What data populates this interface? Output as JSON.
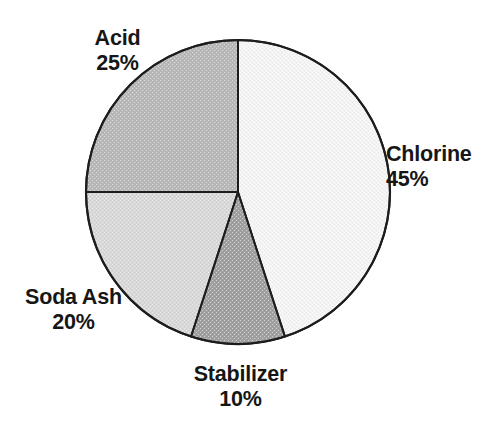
{
  "chart_data": {
    "type": "pie",
    "title": "",
    "subtitle": "",
    "xlabel": "",
    "ylabel": "",
    "legend_position": "none",
    "grid": false,
    "start_angle_deg": 0,
    "direction": "clockwise",
    "value_unit": "%",
    "categories": [
      "Chlorine",
      "Stabilizer",
      "Soda Ash",
      "Acid"
    ],
    "values": [
      45,
      10,
      20,
      25
    ],
    "slices": [
      {
        "name": "Chlorine",
        "value": 45,
        "value_label": "45%",
        "color": "#f4f4f4",
        "start_angle_deg": 0,
        "end_angle_deg": 162,
        "label_position": "right"
      },
      {
        "name": "Stabilizer",
        "value": 10,
        "value_label": "10%",
        "color": "#a0a0a0",
        "start_angle_deg": 162,
        "end_angle_deg": 198,
        "label_position": "bottom"
      },
      {
        "name": "Soda Ash",
        "value": 20,
        "value_label": "20%",
        "color": "#d8d8d8",
        "start_angle_deg": 198,
        "end_angle_deg": 270,
        "label_position": "left"
      },
      {
        "name": "Acid",
        "value": 25,
        "value_label": "25%",
        "color": "#b8b8b8",
        "start_angle_deg": 270,
        "end_angle_deg": 360,
        "label_position": "top-left"
      }
    ]
  },
  "labels": {
    "acid": {
      "name": "Acid",
      "percent": "25%"
    },
    "chlorine": {
      "name": "Chlorine",
      "percent": "45%"
    },
    "soda_ash": {
      "name": "Soda Ash",
      "percent": "20%"
    },
    "stabilizer": {
      "name": "Stabilizer",
      "percent": "10%"
    }
  },
  "style": {
    "background": "#ffffff",
    "outline_color": "#1d1d1d",
    "text_color": "#161616"
  },
  "geometry": {
    "center_x": 238,
    "center_y": 192,
    "radius": 152
  }
}
